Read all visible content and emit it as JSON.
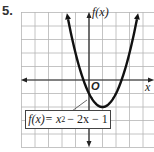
{
  "problem_number": "5.",
  "chart_data": {
    "type": "line",
    "title": "",
    "function": "f(x) = x^2 - 2x - 1",
    "label_text": {
      "fx": "f(x)",
      "eq": " = x",
      "sup": "2",
      "rest": "− 2x − 1"
    },
    "xlabel": "x",
    "ylabel": "f(x)",
    "origin_label": "O",
    "vertex": [
      1,
      -2
    ],
    "x": [
      -1.6,
      -1,
      0,
      1,
      2,
      3,
      3.6
    ],
    "y": [
      4.76,
      2,
      -1,
      -2,
      -1,
      2,
      5.76
    ],
    "xlim": [
      -5,
      4.9
    ],
    "ylim": [
      -5,
      5
    ],
    "grid": true,
    "grid_unit": 1,
    "colors": {
      "curve": "#111111",
      "grid": "#b5b5b5",
      "axis": "#222222"
    }
  }
}
